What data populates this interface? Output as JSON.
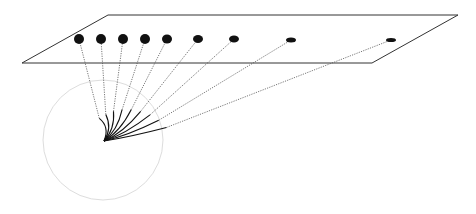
{
  "diagram": {
    "colors": {
      "background": "#ffffff",
      "plane_stroke": "#333333",
      "dot_fill": "#111111",
      "ray_stroke": "#555555",
      "fan_stroke": "#111111",
      "circle_stroke": "#dddddd"
    },
    "plane": {
      "corners": [
        [
          22,
          63
        ],
        [
          108,
          15
        ],
        [
          458,
          15
        ],
        [
          372,
          63
        ]
      ]
    },
    "circle": {
      "cx": 103,
      "cy": 140,
      "r": 60
    },
    "origin": {
      "x": 104,
      "y": 141
    },
    "dots": [
      {
        "x": 79,
        "y": 39,
        "rx": 5,
        "ry": 5
      },
      {
        "x": 101,
        "y": 39,
        "rx": 5,
        "ry": 5
      },
      {
        "x": 123,
        "y": 39,
        "rx": 5,
        "ry": 5
      },
      {
        "x": 145,
        "y": 39,
        "rx": 5,
        "ry": 5
      },
      {
        "x": 167,
        "y": 39,
        "rx": 5,
        "ry": 4.5
      },
      {
        "x": 198,
        "y": 39,
        "rx": 5,
        "ry": 4
      },
      {
        "x": 234,
        "y": 39,
        "rx": 5,
        "ry": 3.5
      },
      {
        "x": 291,
        "y": 40,
        "rx": 5,
        "ry": 2.5
      },
      {
        "x": 391,
        "y": 40,
        "rx": 5,
        "ry": 2
      }
    ]
  }
}
